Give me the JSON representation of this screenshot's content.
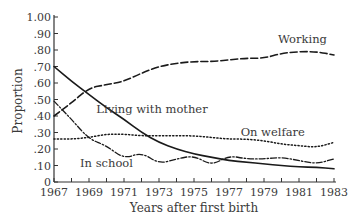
{
  "chart_data": {
    "type": "line",
    "title": "",
    "xlabel": "Years after first birth",
    "ylabel": "Proportion",
    "ylim": [
      0,
      1.0
    ],
    "xlim": [
      1967,
      1983
    ],
    "grid": false,
    "legend_position": "inline labels",
    "x": [
      1967,
      1968,
      1969,
      1970,
      1971,
      1972,
      1973,
      1974,
      1975,
      1976,
      1977,
      1978,
      1979,
      1980,
      1981,
      1982,
      1983
    ],
    "x_tick_labels": [
      "1967",
      "1969",
      "1971",
      "1973",
      "1975",
      "1977",
      "1979",
      "1981",
      "1983"
    ],
    "y_tick_labels": [
      "0",
      ".10",
      ".20",
      ".30",
      ".40",
      ".50",
      ".60",
      ".70",
      ".80",
      ".90",
      "1.00"
    ],
    "series": [
      {
        "name": "Working",
        "style": "dashed",
        "values": [
          0.4,
          0.48,
          0.57,
          0.59,
          0.61,
          0.66,
          0.7,
          0.72,
          0.73,
          0.73,
          0.74,
          0.75,
          0.75,
          0.78,
          0.79,
          0.79,
          0.77
        ]
      },
      {
        "name": "Living with mother",
        "style": "solid",
        "values": [
          0.7,
          0.61,
          0.53,
          0.45,
          0.38,
          0.3,
          0.24,
          0.2,
          0.17,
          0.15,
          0.13,
          0.12,
          0.11,
          0.1,
          0.09,
          0.09,
          0.08
        ]
      },
      {
        "name": "On welfare",
        "style": "dotted",
        "values": [
          0.26,
          0.26,
          0.27,
          0.29,
          0.29,
          0.28,
          0.28,
          0.28,
          0.28,
          0.27,
          0.26,
          0.26,
          0.25,
          0.23,
          0.22,
          0.21,
          0.24
        ]
      },
      {
        "name": "In school",
        "style": "dash-dot",
        "values": [
          0.49,
          0.38,
          0.26,
          0.22,
          0.14,
          0.18,
          0.11,
          0.14,
          0.16,
          0.1,
          0.16,
          0.14,
          0.14,
          0.15,
          0.13,
          0.11,
          0.14
        ]
      }
    ],
    "annotations": [
      {
        "text": "Working",
        "x": 1981.2,
        "y": 0.84
      },
      {
        "text": "Living with mother",
        "x": 1972.6,
        "y": 0.42
      },
      {
        "text": "On welfare",
        "x": 1979.5,
        "y": 0.28
      },
      {
        "text": "In school",
        "x": 1970.0,
        "y": 0.09
      }
    ]
  }
}
